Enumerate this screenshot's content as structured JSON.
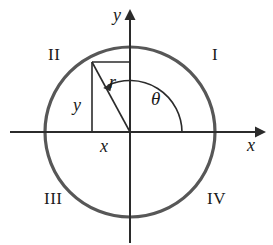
{
  "figure": {
    "type": "unit-circle-quadrant-diagram",
    "quadrant_labels": [
      {
        "id": "I",
        "text": "I"
      },
      {
        "id": "II",
        "text": "II"
      },
      {
        "id": "III",
        "text": "III"
      },
      {
        "id": "IV",
        "text": "IV"
      }
    ],
    "axis_labels": {
      "x": "x",
      "y": "y"
    },
    "variable_labels": {
      "radius": "r",
      "vertical_leg": "y",
      "horizontal_leg": "x",
      "angle": "θ"
    },
    "colors": {
      "circle_stroke": "#575757",
      "axis_stroke": "#2b2b2b",
      "triangle_stroke": "#2b2b2b",
      "arc_stroke": "#2b2b2b",
      "text": "#1a1a1a",
      "background": "#ffffff"
    },
    "geometry": {
      "center": [
        130,
        132
      ],
      "radius": 85,
      "terminal_point": [
        92,
        62
      ],
      "angle_degrees": 118,
      "circle_stroke_width": 3.2,
      "axis_stroke_width": 2,
      "triangle_stroke_width": 1.6,
      "x_axis_span": [
        10,
        262
      ],
      "y_axis_span": [
        8,
        243
      ]
    }
  }
}
